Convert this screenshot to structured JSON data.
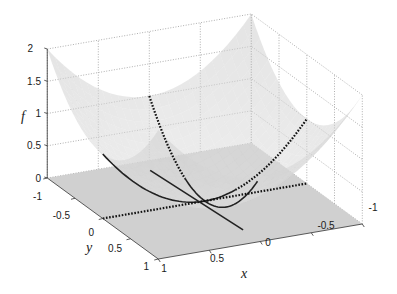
{
  "chart_data": {
    "type": "surface3d",
    "title": "",
    "surface": {
      "expression": "f = x^2 + y^2",
      "x_range": [
        -1,
        1
      ],
      "y_range": [
        -1,
        1
      ],
      "z_clip": 2,
      "color": "#d9d9d9"
    },
    "plane": {
      "z": 0,
      "color": "#c8c8c8"
    },
    "xlabel": "x",
    "ylabel": "y",
    "zlabel": "f",
    "xlim": [
      -1,
      1
    ],
    "ylim": [
      -1,
      1
    ],
    "zlim": [
      0,
      2
    ],
    "x_ticks": [
      "-1",
      "-0.5",
      "0",
      "0.5",
      "1"
    ],
    "y_ticks": [
      "-1",
      "-0.5",
      "0",
      "0.5",
      "1"
    ],
    "z_ticks": [
      "0",
      "0.5",
      "1",
      "1.5",
      "2"
    ],
    "grid": true,
    "curves": [
      {
        "name": "slice-y0",
        "description": "f along y = 0",
        "style": "solid-then-dotted",
        "x": [
          1,
          -1
        ],
        "y": [
          0,
          0
        ],
        "z": "x^2"
      },
      {
        "name": "slice-x0",
        "description": "f along x = 0",
        "style": "dotted-then-solid",
        "x": [
          0,
          0
        ],
        "y": [
          -1,
          1
        ],
        "z": "y^2"
      },
      {
        "name": "floor-line-y0",
        "description": "line y = 0 on plane f = 0",
        "style": "dotted",
        "x": [
          1,
          -1
        ],
        "y": [
          0,
          0
        ],
        "z": 0
      },
      {
        "name": "tangent-line",
        "description": "line through minimum",
        "style": "solid",
        "x": [
          0.1,
          0.01
        ],
        "y": [
          -0.8,
          0.71
        ],
        "z": 0
      }
    ]
  }
}
